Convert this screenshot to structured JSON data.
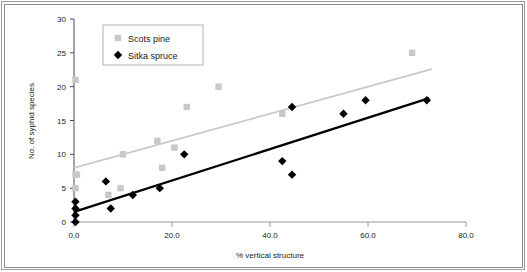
{
  "chart_data": {
    "type": "scatter",
    "title": "",
    "xlabel": "% vertical structure",
    "ylabel": "No. of syphid species",
    "xlim": [
      0,
      80
    ],
    "ylim": [
      0,
      30
    ],
    "xticks": [
      "0.0",
      "20.0",
      "40.0",
      "60.0",
      "80.0"
    ],
    "xtick_values": [
      0,
      20,
      40,
      60,
      80
    ],
    "yticks": [
      "0",
      "5",
      "10",
      "15",
      "20",
      "25",
      "30"
    ],
    "ytick_values": [
      0,
      5,
      10,
      15,
      20,
      25,
      30
    ],
    "grid": false,
    "legend_position": "top-left-inside",
    "series": [
      {
        "name": "Scots pine",
        "marker": "square",
        "color": "#c8c8c8",
        "points": [
          [
            0.3,
            21
          ],
          [
            0.3,
            7
          ],
          [
            0.6,
            7
          ],
          [
            0.3,
            5
          ],
          [
            7.0,
            4
          ],
          [
            9.5,
            5
          ],
          [
            10.0,
            10
          ],
          [
            17.0,
            12
          ],
          [
            18.0,
            8
          ],
          [
            20.5,
            11
          ],
          [
            23.0,
            17
          ],
          [
            29.5,
            20
          ],
          [
            42.5,
            16
          ],
          [
            69.0,
            25
          ]
        ],
        "trendline": {
          "x0": 0,
          "y0": 8.0,
          "x1": 73.0,
          "y1": 22.6,
          "color": "#c8c8c8"
        }
      },
      {
        "name": "Sitka spruce",
        "marker": "diamond",
        "color": "#000000",
        "points": [
          [
            0.3,
            0
          ],
          [
            0.3,
            1
          ],
          [
            0.3,
            2
          ],
          [
            0.3,
            3
          ],
          [
            6.5,
            6
          ],
          [
            7.5,
            2
          ],
          [
            12.0,
            4
          ],
          [
            17.5,
            5
          ],
          [
            22.5,
            10
          ],
          [
            42.5,
            9
          ],
          [
            44.5,
            7
          ],
          [
            44.5,
            17
          ],
          [
            55.0,
            16
          ],
          [
            59.5,
            18
          ],
          [
            72.0,
            18
          ]
        ],
        "trendline": {
          "x0": 0,
          "y0": 1.5,
          "x1": 72.5,
          "y1": 18.3,
          "color": "#000000"
        }
      }
    ]
  },
  "legend": {
    "items": [
      {
        "label": "Scots pine",
        "marker": "square",
        "color": "#c8c8c8"
      },
      {
        "label": "Sitka spruce",
        "marker": "diamond",
        "color": "#000000"
      }
    ]
  },
  "axes": {
    "x_title": "% vertical structure",
    "y_title": "No. of syphid species"
  }
}
